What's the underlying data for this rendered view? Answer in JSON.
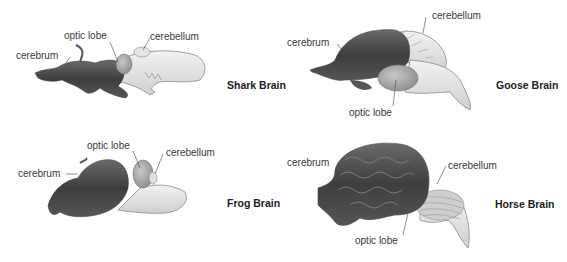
{
  "panels": [
    {
      "id": "shark",
      "title": "Shark Brain",
      "labels": {
        "cerebrum": "cerebrum",
        "optic_lobe": "optic lobe",
        "cerebellum": "cerebellum"
      }
    },
    {
      "id": "goose",
      "title": "Goose Brain",
      "labels": {
        "cerebrum": "cerebrum",
        "optic_lobe": "optic lobe",
        "cerebellum": "cerebellum"
      }
    },
    {
      "id": "frog",
      "title": "Frog Brain",
      "labels": {
        "cerebrum": "cerebrum",
        "optic_lobe": "optic lobe",
        "cerebellum": "cerebellum"
      }
    },
    {
      "id": "horse",
      "title": "Horse Brain",
      "labels": {
        "cerebrum": "cerebrum",
        "optic_lobe": "optic lobe",
        "cerebellum": "cerebellum"
      }
    }
  ],
  "colors": {
    "cerebrum_dark": "#4a4a4a",
    "tissue_light": "#d9d9d9",
    "outline": "#8a8a8a",
    "leader_line": "#444444"
  }
}
